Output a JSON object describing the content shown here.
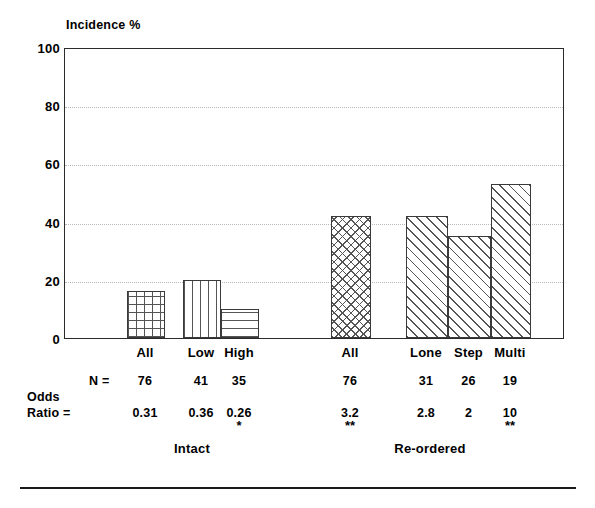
{
  "chart_data": {
    "type": "bar",
    "title": "",
    "ylabel": "Incidence %",
    "xlabel": "",
    "ylim": [
      0,
      100
    ],
    "yticks": [
      0,
      20,
      40,
      60,
      80,
      100
    ],
    "ytick_labels": [
      "0",
      "20",
      "40",
      "60",
      "80",
      "100"
    ],
    "grid": true,
    "legend": "none",
    "categories": [
      "All",
      "Low",
      "High",
      "All",
      "Lone",
      "Step",
      "Multi"
    ],
    "values": [
      16,
      20,
      10,
      42,
      42,
      35,
      53
    ],
    "groups": [
      {
        "label": "Intact",
        "categories": [
          "All",
          "Low",
          "High"
        ]
      },
      {
        "label": "Re-ordered",
        "categories": [
          "All",
          "Lone",
          "Step",
          "Multi"
        ]
      }
    ],
    "annotations": {
      "n_row_label": "N =",
      "n_values": [
        "76",
        "41",
        "35",
        "76",
        "31",
        "26",
        "19"
      ],
      "odds_row_label_line1": "Odds",
      "odds_row_label_line2": "Ratio =",
      "odds_values": [
        "0.31",
        "0.36",
        "0.26",
        "3.2",
        "2.8",
        "2",
        "10"
      ],
      "significance": [
        "",
        "",
        "*",
        "**",
        "",
        "",
        "**"
      ]
    },
    "bars": [
      {
        "label": "All",
        "value": 16,
        "pattern": "square-grid",
        "x": 126,
        "width": 38,
        "group": "Intact"
      },
      {
        "label": "Low",
        "value": 20,
        "pattern": "vertical-lines",
        "x": 182,
        "width": 38,
        "group": "Intact"
      },
      {
        "label": "High",
        "value": 10,
        "pattern": "horizontal-lines",
        "x": 220,
        "width": 38,
        "group": "Intact"
      },
      {
        "label": "All",
        "value": 42,
        "pattern": "diagonal-crosshatch",
        "x": 330,
        "width": 40,
        "group": "Re-ordered"
      },
      {
        "label": "Lone",
        "value": 42,
        "pattern": "diagonal-forward",
        "x": 405,
        "width": 42,
        "group": "Re-ordered"
      },
      {
        "label": "Step",
        "value": 35,
        "pattern": "diagonal-forward",
        "x": 447,
        "width": 43,
        "group": "Re-ordered"
      },
      {
        "label": "Multi",
        "value": 53,
        "pattern": "diagonal-forward",
        "x": 490,
        "width": 40,
        "group": "Re-ordered"
      }
    ],
    "colors": {
      "background": "#ffffff",
      "axis": "#2b2b2b",
      "gridline": "#b9b9b9",
      "bar_outline": "#3a3a3a",
      "pattern": "#555555",
      "text": "#000000"
    }
  }
}
